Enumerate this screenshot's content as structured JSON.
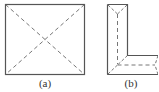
{
  "figures": [
    {
      "id": "a",
      "label": "(a)",
      "shape": "square-with-dashed-diagonals"
    },
    {
      "id": "b",
      "label": "(b)",
      "shape": "L-shape-with-dashed-medial-lines"
    }
  ],
  "colors": {
    "stroke": "#555555",
    "dashed": "#666666",
    "background": "#ffffff"
  }
}
